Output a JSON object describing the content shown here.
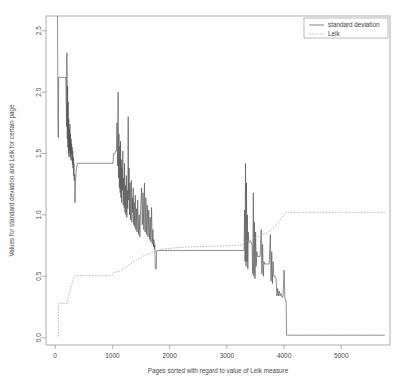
{
  "chart_data": {
    "type": "line",
    "title": "",
    "subtitle": "",
    "xlabel": "Pages sorted with regard to value of Leik measure",
    "ylabel": "Values for standard deviation and Leik for certain page",
    "xlim": [
      -160,
      5850
    ],
    "ylim": [
      -0.06,
      2.62
    ],
    "xticks": [
      0,
      1000,
      2000,
      3000,
      4000,
      5000
    ],
    "xtick_labels": [
      "0",
      "1000",
      "2000",
      "3000",
      "4000",
      "5000"
    ],
    "yticks": [
      0.0,
      0.5,
      1.0,
      1.5,
      2.0,
      2.5
    ],
    "ytick_labels": [
      "0.0",
      "0.5",
      "1.0",
      "1.5",
      "2.0",
      "2.5"
    ],
    "grid": false,
    "legend_position": "top-right",
    "legend": [
      {
        "name": "standard deviation",
        "style": "solid",
        "color": "#4b4b4b"
      },
      {
        "name": "Leik",
        "style": "dashed",
        "color": "#9a9a9a"
      }
    ],
    "series": [
      {
        "name": "standard deviation",
        "style": "solid",
        "color": "#4b4b4b",
        "points": [
          [
            40,
            2.62
          ],
          [
            42,
            2.6
          ],
          [
            48,
            1.8
          ],
          [
            55,
            1.63
          ],
          [
            62,
            2.12
          ],
          [
            120,
            2.12
          ],
          [
            170,
            2.12
          ],
          [
            185,
            2.12
          ],
          [
            200,
            1.72
          ],
          [
            205,
            2.32
          ],
          [
            212,
            1.62
          ],
          [
            218,
            2.05
          ],
          [
            222,
            1.55
          ],
          [
            228,
            1.92
          ],
          [
            232,
            1.5
          ],
          [
            238,
            1.78
          ],
          [
            242,
            1.47
          ],
          [
            248,
            1.7
          ],
          [
            252,
            1.52
          ],
          [
            258,
            1.74
          ],
          [
            262,
            1.48
          ],
          [
            268,
            1.66
          ],
          [
            272,
            1.45
          ],
          [
            278,
            1.62
          ],
          [
            282,
            1.5
          ],
          [
            288,
            1.58
          ],
          [
            292,
            1.44
          ],
          [
            298,
            1.55
          ],
          [
            302,
            1.41
          ],
          [
            308,
            1.52
          ],
          [
            312,
            1.38
          ],
          [
            318,
            1.47
          ],
          [
            322,
            1.32
          ],
          [
            328,
            1.42
          ],
          [
            332,
            1.28
          ],
          [
            340,
            1.33
          ],
          [
            346,
            1.1
          ],
          [
            352,
            1.22
          ],
          [
            360,
            1.3
          ],
          [
            372,
            1.38
          ],
          [
            390,
            1.42
          ],
          [
            430,
            1.42
          ],
          [
            600,
            1.42
          ],
          [
            800,
            1.42
          ],
          [
            980,
            1.42
          ],
          [
            1010,
            1.42
          ],
          [
            1020,
            1.5
          ],
          [
            1040,
            1.5
          ],
          [
            1055,
            1.52
          ],
          [
            1070,
            1.52
          ],
          [
            1080,
            1.75
          ],
          [
            1090,
            1.4
          ],
          [
            1100,
            2.0
          ],
          [
            1108,
            1.3
          ],
          [
            1115,
            1.66
          ],
          [
            1122,
            1.22
          ],
          [
            1130,
            1.56
          ],
          [
            1136,
            1.18
          ],
          [
            1142,
            1.6
          ],
          [
            1148,
            1.14
          ],
          [
            1155,
            1.45
          ],
          [
            1162,
            1.1
          ],
          [
            1168,
            1.38
          ],
          [
            1175,
            1.2
          ],
          [
            1182,
            1.52
          ],
          [
            1190,
            1.08
          ],
          [
            1198,
            1.3
          ],
          [
            1205,
            1.06
          ],
          [
            1212,
            1.42
          ],
          [
            1220,
            1.02
          ],
          [
            1228,
            1.24
          ],
          [
            1236,
            1.0
          ],
          [
            1244,
            1.32
          ],
          [
            1252,
            0.98
          ],
          [
            1260,
            1.2
          ],
          [
            1268,
            1.05
          ],
          [
            1276,
            1.8
          ],
          [
            1284,
            1.12
          ],
          [
            1292,
            1.38
          ],
          [
            1300,
            1.0
          ],
          [
            1308,
            1.26
          ],
          [
            1316,
            0.96
          ],
          [
            1324,
            1.18
          ],
          [
            1332,
            1.28
          ],
          [
            1340,
            0.94
          ],
          [
            1348,
            1.14
          ],
          [
            1356,
            1.02
          ],
          [
            1364,
            1.22
          ],
          [
            1372,
            0.92
          ],
          [
            1380,
            1.1
          ],
          [
            1390,
            0.9
          ],
          [
            1400,
            1.16
          ],
          [
            1410,
            0.88
          ],
          [
            1420,
            1.05
          ],
          [
            1430,
            0.86
          ],
          [
            1442,
            1.12
          ],
          [
            1455,
            0.84
          ],
          [
            1468,
            1.0
          ],
          [
            1480,
            0.82
          ],
          [
            1495,
            1.08
          ],
          [
            1510,
            1.22
          ],
          [
            1522,
            0.92
          ],
          [
            1535,
            1.18
          ],
          [
            1548,
            0.88
          ],
          [
            1560,
            1.26
          ],
          [
            1572,
            0.86
          ],
          [
            1585,
            1.14
          ],
          [
            1598,
            0.84
          ],
          [
            1610,
            1.08
          ],
          [
            1622,
            0.82
          ],
          [
            1635,
            1.04
          ],
          [
            1648,
            0.8
          ],
          [
            1660,
            0.98
          ],
          [
            1672,
            0.78
          ],
          [
            1684,
            1.06
          ],
          [
            1696,
            0.76
          ],
          [
            1708,
            0.88
          ],
          [
            1718,
            0.74
          ],
          [
            1726,
            0.8
          ],
          [
            1734,
            0.72
          ],
          [
            1742,
            0.76
          ],
          [
            1750,
            0.56
          ],
          [
            1758,
            0.56
          ],
          [
            1766,
            0.56
          ],
          [
            1774,
            0.71
          ],
          [
            1790,
            0.71
          ],
          [
            1900,
            0.71
          ],
          [
            2100,
            0.71
          ],
          [
            2400,
            0.71
          ],
          [
            2700,
            0.71
          ],
          [
            3000,
            0.71
          ],
          [
            3200,
            0.71
          ],
          [
            3280,
            0.71
          ],
          [
            3300,
            0.71
          ],
          [
            3310,
            1.04
          ],
          [
            3318,
            0.62
          ],
          [
            3326,
            1.42
          ],
          [
            3334,
            0.58
          ],
          [
            3342,
            1.26
          ],
          [
            3350,
            0.62
          ],
          [
            3358,
            1.0
          ],
          [
            3366,
            0.56
          ],
          [
            3374,
            0.86
          ],
          [
            3382,
            0.78
          ],
          [
            3390,
            0.78
          ],
          [
            3400,
            0.78
          ],
          [
            3420,
            0.78
          ],
          [
            3440,
            0.76
          ],
          [
            3452,
            0.52
          ],
          [
            3462,
            1.18
          ],
          [
            3472,
            0.5
          ],
          [
            3482,
            0.94
          ],
          [
            3492,
            0.48
          ],
          [
            3502,
            0.86
          ],
          [
            3512,
            0.58
          ],
          [
            3524,
            0.7
          ],
          [
            3536,
            0.66
          ],
          [
            3548,
            0.66
          ],
          [
            3560,
            0.66
          ],
          [
            3580,
            0.66
          ],
          [
            3600,
            0.88
          ],
          [
            3612,
            0.52
          ],
          [
            3624,
            0.76
          ],
          [
            3636,
            0.5
          ],
          [
            3648,
            0.62
          ],
          [
            3660,
            0.6
          ],
          [
            3680,
            0.6
          ],
          [
            3700,
            0.6
          ],
          [
            3720,
            0.6
          ],
          [
            3740,
            0.6
          ],
          [
            3760,
            0.84
          ],
          [
            3772,
            0.46
          ],
          [
            3784,
            0.7
          ],
          [
            3796,
            0.44
          ],
          [
            3808,
            0.62
          ],
          [
            3820,
            0.5
          ],
          [
            3832,
            0.5
          ],
          [
            3844,
            0.5
          ],
          [
            3860,
            0.48
          ],
          [
            3874,
            0.34
          ],
          [
            3888,
            0.4
          ],
          [
            3900,
            0.34
          ],
          [
            3914,
            0.38
          ],
          [
            3928,
            0.34
          ],
          [
            3944,
            0.36
          ],
          [
            3960,
            0.33
          ],
          [
            3980,
            0.33
          ],
          [
            4000,
            0.55
          ],
          [
            4012,
            0.33
          ],
          [
            4024,
            0.3
          ],
          [
            4036,
            0.3
          ],
          [
            4042,
            0.02
          ],
          [
            4060,
            0.02
          ],
          [
            4300,
            0.02
          ],
          [
            4700,
            0.02
          ],
          [
            5000,
            0.02
          ],
          [
            5400,
            0.02
          ],
          [
            5700,
            0.02
          ],
          [
            5760,
            0.02
          ]
        ]
      },
      {
        "name": "Leik",
        "style": "dashed",
        "color": "#9a9a9a",
        "points": [
          [
            55,
            0.01
          ],
          [
            58,
            0.02
          ],
          [
            60,
            0.28
          ],
          [
            120,
            0.28
          ],
          [
            180,
            0.28
          ],
          [
            210,
            0.28
          ],
          [
            230,
            0.33
          ],
          [
            260,
            0.38
          ],
          [
            290,
            0.43
          ],
          [
            320,
            0.48
          ],
          [
            350,
            0.505
          ],
          [
            420,
            0.505
          ],
          [
            550,
            0.505
          ],
          [
            700,
            0.505
          ],
          [
            850,
            0.505
          ],
          [
            950,
            0.505
          ],
          [
            1000,
            0.51
          ],
          [
            1030,
            0.535
          ],
          [
            1060,
            0.535
          ],
          [
            1090,
            0.535
          ],
          [
            1120,
            0.54
          ],
          [
            1180,
            0.555
          ],
          [
            1240,
            0.575
          ],
          [
            1300,
            0.595
          ],
          [
            1360,
            0.615
          ],
          [
            1420,
            0.63
          ],
          [
            1480,
            0.645
          ],
          [
            1540,
            0.665
          ],
          [
            1600,
            0.675
          ],
          [
            1660,
            0.685
          ],
          [
            1720,
            0.695
          ],
          [
            1790,
            0.71
          ],
          [
            1860,
            0.72
          ],
          [
            1950,
            0.725
          ],
          [
            2050,
            0.73
          ],
          [
            2200,
            0.735
          ],
          [
            2400,
            0.74
          ],
          [
            2600,
            0.743
          ],
          [
            2800,
            0.746
          ],
          [
            3000,
            0.749
          ],
          [
            3150,
            0.752
          ],
          [
            3280,
            0.755
          ],
          [
            3320,
            0.785
          ],
          [
            3360,
            0.79
          ],
          [
            3400,
            0.79
          ],
          [
            3440,
            0.8
          ],
          [
            3480,
            0.81
          ],
          [
            3520,
            0.818
          ],
          [
            3560,
            0.826
          ],
          [
            3600,
            0.834
          ],
          [
            3640,
            0.842
          ],
          [
            3680,
            0.85
          ],
          [
            3720,
            0.86
          ],
          [
            3760,
            0.87
          ],
          [
            3800,
            0.885
          ],
          [
            3840,
            0.9
          ],
          [
            3880,
            0.925
          ],
          [
            3920,
            0.95
          ],
          [
            3960,
            0.975
          ],
          [
            4000,
            1.0
          ],
          [
            4030,
            1.02
          ],
          [
            4100,
            1.02
          ],
          [
            4300,
            1.02
          ],
          [
            4600,
            1.02
          ],
          [
            4900,
            1.02
          ],
          [
            5200,
            1.02
          ],
          [
            5500,
            1.02
          ],
          [
            5760,
            1.02
          ]
        ]
      }
    ]
  },
  "axes": {
    "x_axis_name": "x-axis",
    "y_axis_name": "y-axis"
  }
}
